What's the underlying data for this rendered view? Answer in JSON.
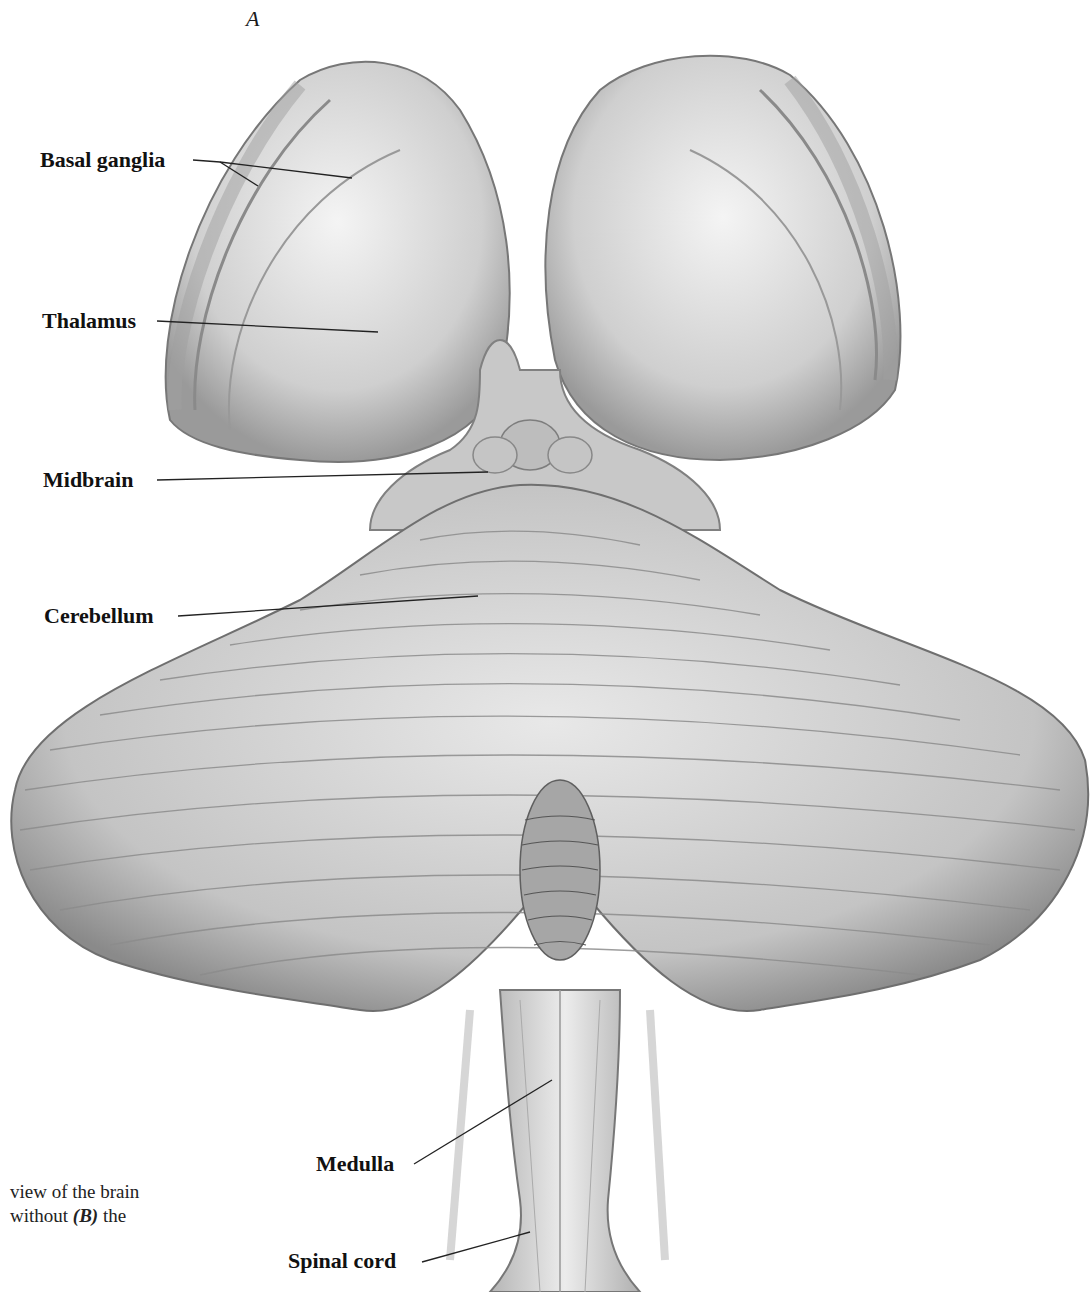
{
  "figure": {
    "panel_letter": "A",
    "labels": [
      {
        "id": "basal-ganglia",
        "text": "Basal ganglia"
      },
      {
        "id": "thalamus",
        "text": "Thalamus"
      },
      {
        "id": "midbrain",
        "text": "Midbrain"
      },
      {
        "id": "cerebellum",
        "text": "Cerebellum"
      },
      {
        "id": "medulla",
        "text": "Medulla"
      },
      {
        "id": "spinal-cord",
        "text": "Spinal cord"
      }
    ],
    "caption": {
      "line1": "view of the brain",
      "line2_prefix": "without ",
      "line2_ref": "(B)",
      "line2_suffix": " the"
    }
  }
}
